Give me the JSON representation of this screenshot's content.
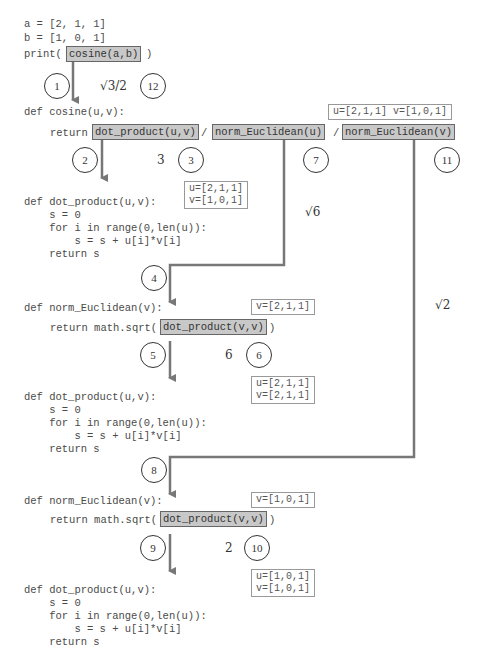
{
  "top_code": [
    "a = [2, 1, 1]",
    "b = [1, 0, 1]"
  ],
  "print_prefix": "print(",
  "print_suffix": ")",
  "call_cosine": "cosine(a,b)",
  "steps": {
    "s1": "1",
    "s2": "2",
    "s3": "3",
    "s4": "4",
    "s5": "5",
    "s6": "6",
    "s7": "7",
    "s8": "8",
    "s9": "9",
    "s10": "10",
    "s11": "11",
    "s12": "12"
  },
  "values": {
    "cosine_result": "√3/2",
    "dot_uv_result": "3",
    "norm_u_result": "√6",
    "dot_vv_1_result": "6",
    "norm_v_result": "√2",
    "dot_vv_2_result": "2"
  },
  "cosine_block": {
    "def": "def cosine(u,v):",
    "return_kw": "return",
    "call_dot": "dot_product(u,v)",
    "slash": "/",
    "call_norm_u": "norm_Euclidean(u)",
    "call_norm_v": "norm_Euclidean(v)",
    "args": "u=[2,1,1] v=[1,0,1]"
  },
  "dot_block_1": {
    "lines": [
      "def dot_product(u,v):",
      "    s = 0",
      "    for i in range(0,len(u)):",
      "        s = s + u[i]*v[i]",
      "    return s"
    ],
    "args": "u=[2,1,1]\nv=[1,0,1]"
  },
  "norm_block_1": {
    "def": "def norm_Euclidean(v):",
    "return_prefix": "return math.sqrt(",
    "call_dot": "dot_product(v,v)",
    "return_suffix": ")",
    "args": "v=[2,1,1]"
  },
  "dot_block_2": {
    "lines": [
      "def dot_product(u,v):",
      "    s = 0",
      "    for i in range(0,len(u)):",
      "        s = s + u[i]*v[i]",
      "    return s"
    ],
    "args": "u=[2,1,1]\nv=[2,1,1]"
  },
  "norm_block_2": {
    "def": "def norm_Euclidean(v):",
    "return_prefix": "return math.sqrt(",
    "call_dot": "dot_product(v,v)",
    "return_suffix": ")",
    "args": "v=[1,0,1]"
  },
  "dot_block_3": {
    "lines": [
      "def dot_product(u,v):",
      "    s = 0",
      "    for i in range(0,len(u)):",
      "        s = s + u[i]*v[i]",
      "    return s"
    ],
    "args": "u=[1,0,1]\nv=[1,0,1]"
  },
  "colors": {
    "arrow": "#777777",
    "highlight": "#c8c8c8",
    "circle": "#333333"
  }
}
